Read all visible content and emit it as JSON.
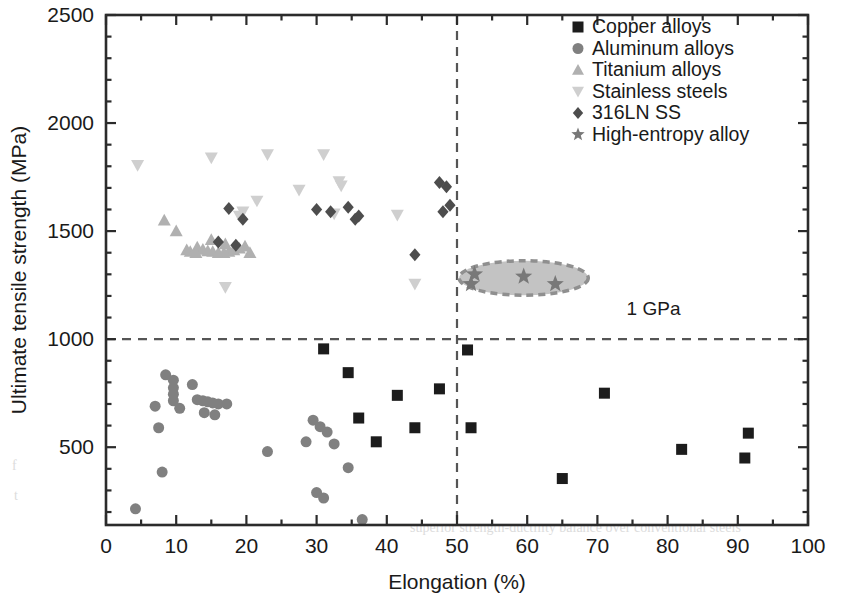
{
  "chart_data": {
    "type": "scatter",
    "title": "",
    "xlabel": "Elongation (%)",
    "ylabel": "Ultimate tensile strength (MPa)",
    "xlim": [
      0,
      100
    ],
    "ylim": [
      140,
      2500
    ],
    "xticks": [
      0,
      10,
      20,
      30,
      40,
      50,
      60,
      70,
      80,
      90,
      100
    ],
    "xtick_labels": [
      "0",
      "10",
      "20",
      "30",
      "40",
      "50",
      "60",
      "70",
      "80",
      "90",
      "100"
    ],
    "yticks": [
      500,
      1000,
      1500,
      2000,
      2500
    ],
    "ytick_labels": [
      "500",
      "1000",
      "1500",
      "2000",
      "2500"
    ],
    "minor_ticks": true,
    "grid": false,
    "legend_position": "top-right",
    "annotations": [
      {
        "text": "1 GPa",
        "x": 78,
        "y": 1110
      }
    ],
    "reference_lines": [
      {
        "orientation": "horizontal",
        "value": 1000,
        "style": "dashed",
        "color": "#555555"
      },
      {
        "orientation": "vertical",
        "value": 50,
        "style": "dashed",
        "color": "#555555"
      }
    ],
    "highlight_regions": [
      {
        "shape": "ellipse",
        "label": "high-entropy-alloy-cluster",
        "cx": 59.5,
        "cy": 1283,
        "rx": 9.2,
        "ry": 80,
        "fill": "#b9b9b9",
        "stroke": "#8f8f8f",
        "stroke_style": "dashed"
      }
    ],
    "series": [
      {
        "name": "Copper alloys",
        "marker": "square",
        "color": "#1c1c1c",
        "size": 11,
        "points": [
          [
            31.0,
            955
          ],
          [
            34.5,
            845
          ],
          [
            41.5,
            740
          ],
          [
            36.0,
            635
          ],
          [
            44.0,
            590
          ],
          [
            38.5,
            525
          ],
          [
            47.5,
            770
          ],
          [
            51.5,
            950
          ],
          [
            52.0,
            590
          ],
          [
            65.0,
            355
          ],
          [
            71.0,
            750
          ],
          [
            82.0,
            490
          ],
          [
            91.5,
            565
          ],
          [
            91.0,
            450
          ]
        ]
      },
      {
        "name": "Aluminum alloys",
        "marker": "circle",
        "color": "#808080",
        "size": 11,
        "points": [
          [
            4.2,
            215
          ],
          [
            8.0,
            385
          ],
          [
            7.5,
            590
          ],
          [
            8.5,
            835
          ],
          [
            9.6,
            810
          ],
          [
            9.6,
            775
          ],
          [
            9.6,
            745
          ],
          [
            9.6,
            715
          ],
          [
            7.0,
            690
          ],
          [
            10.5,
            680
          ],
          [
            12.3,
            790
          ],
          [
            13.0,
            720
          ],
          [
            13.8,
            715
          ],
          [
            14.5,
            710
          ],
          [
            15.2,
            705
          ],
          [
            16.0,
            700
          ],
          [
            14.0,
            660
          ],
          [
            15.5,
            650
          ],
          [
            17.2,
            700
          ],
          [
            23.0,
            480
          ],
          [
            28.5,
            525
          ],
          [
            29.5,
            625
          ],
          [
            30.5,
            595
          ],
          [
            31.5,
            570
          ],
          [
            32.5,
            515
          ],
          [
            30.0,
            290
          ],
          [
            31.0,
            265
          ],
          [
            34.5,
            405
          ],
          [
            36.5,
            165
          ]
        ]
      },
      {
        "name": "Titanium alloys",
        "marker": "triangle-up",
        "color": "#b0b0b0",
        "size": 13,
        "points": [
          [
            8.3,
            1550
          ],
          [
            10.0,
            1500
          ],
          [
            13.0,
            1425
          ],
          [
            13.8,
            1415
          ],
          [
            14.5,
            1408
          ],
          [
            15.2,
            1405
          ],
          [
            16.0,
            1400
          ],
          [
            16.8,
            1400
          ],
          [
            17.5,
            1405
          ],
          [
            18.2,
            1412
          ],
          [
            19.0,
            1420
          ],
          [
            19.8,
            1430
          ],
          [
            12.0,
            1405
          ],
          [
            12.8,
            1400
          ],
          [
            11.5,
            1412
          ],
          [
            20.5,
            1400
          ],
          [
            15.0,
            1460
          ],
          [
            17.0,
            1440
          ]
        ]
      },
      {
        "name": "Stainless steels",
        "marker": "triangle-down",
        "color": "#cfcfcf",
        "size": 13,
        "points": [
          [
            4.5,
            1805
          ],
          [
            15.0,
            1840
          ],
          [
            23.0,
            1855
          ],
          [
            27.5,
            1690
          ],
          [
            19.5,
            1590
          ],
          [
            21.5,
            1640
          ],
          [
            31.0,
            1855
          ],
          [
            33.5,
            1710
          ],
          [
            33.2,
            1730
          ],
          [
            32.5,
            1580
          ],
          [
            17.0,
            1240
          ],
          [
            19.0,
            1570
          ],
          [
            41.5,
            1575
          ],
          [
            44.0,
            1255
          ]
        ]
      },
      {
        "name": "316LN SS",
        "marker": "diamond",
        "color": "#4d4d4d",
        "size": 13,
        "points": [
          [
            17.5,
            1605
          ],
          [
            19.5,
            1555
          ],
          [
            16.0,
            1450
          ],
          [
            18.5,
            1435
          ],
          [
            30.0,
            1600
          ],
          [
            32.0,
            1590
          ],
          [
            34.5,
            1610
          ],
          [
            35.5,
            1555
          ],
          [
            36.0,
            1570
          ],
          [
            47.5,
            1725
          ],
          [
            48.5,
            1705
          ],
          [
            48.0,
            1590
          ],
          [
            49.0,
            1620
          ],
          [
            44.0,
            1390
          ]
        ]
      },
      {
        "name": "High-entropy alloy",
        "marker": "star",
        "color": "#787878",
        "size": 18,
        "points": [
          [
            52.5,
            1300
          ],
          [
            59.5,
            1290
          ],
          [
            64.0,
            1255
          ],
          [
            52.0,
            1255
          ]
        ]
      }
    ]
  },
  "legend": {
    "entries": [
      {
        "label": "Copper alloys",
        "marker": "square",
        "color": "#1c1c1c"
      },
      {
        "label": "Aluminum alloys",
        "marker": "circle",
        "color": "#808080"
      },
      {
        "label": "Titanium alloys",
        "marker": "triangle-up",
        "color": "#b0b0b0"
      },
      {
        "label": "Stainless steels",
        "marker": "triangle-down",
        "color": "#cfcfcf"
      },
      {
        "label": "316LN SS",
        "marker": "diamond",
        "color": "#4d4d4d"
      },
      {
        "label": "High-entropy alloy",
        "marker": "star",
        "color": "#787878"
      }
    ]
  },
  "ghost_text": [
    {
      "text": "Table 1. Comparison of mechanical properties between various",
      "x": 430,
      "y": 468
    },
    {
      "text": "alloys shows that the high-entropy alloy exhibits",
      "x": 418,
      "y": 500
    },
    {
      "text": "superior strength-ductility balance over conventional steels",
      "x": 410,
      "y": 532
    },
    {
      "text": "f",
      "x": 12,
      "y": 470
    },
    {
      "text": "t",
      "x": 14,
      "y": 500
    }
  ]
}
